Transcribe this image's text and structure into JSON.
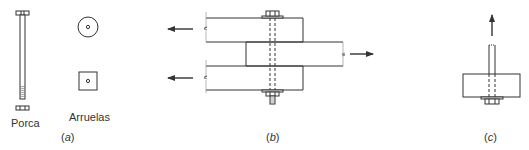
{
  "figure": {
    "panel_a": {
      "label_nut": "Porca",
      "label_washers": "Arruelas",
      "caption_open": "(",
      "caption_letter": "a",
      "caption_close": ")"
    },
    "panel_b": {
      "caption_open": "(",
      "caption_letter": "b",
      "caption_close": ")"
    },
    "panel_c": {
      "caption_open": "(",
      "caption_letter": "c",
      "caption_close": ")"
    }
  },
  "colors": {
    "stroke": "#333333",
    "background": "#ffffff"
  }
}
